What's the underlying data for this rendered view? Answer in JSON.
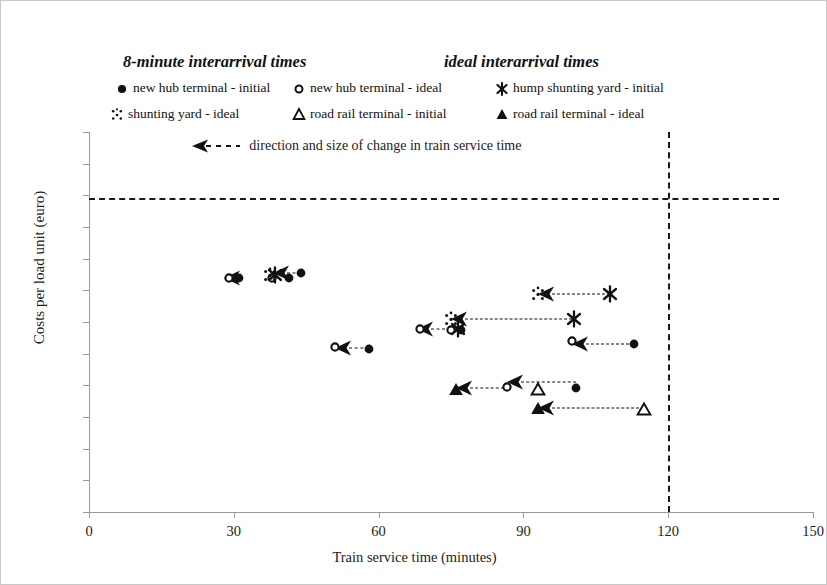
{
  "legend": {
    "group_titles": [
      {
        "text": "8-minute interarrival times"
      },
      {
        "text": "ideal interarrival times"
      }
    ],
    "entries": [
      {
        "label": "new hub terminal - initial",
        "marker": "filled-circle-icon"
      },
      {
        "label": "new hub terminal - ideal",
        "marker": "hollow-circle-icon"
      },
      {
        "label": "hump shunting yard - initial",
        "marker": "filled-star-icon"
      },
      {
        "label": "shunting yard - ideal",
        "marker": "dotted-star-icon"
      },
      {
        "label": "road rail terminal - initial",
        "marker": "hollow-triangle-icon"
      },
      {
        "label": "road rail terminal - ideal",
        "marker": "filled-triangle-icon"
      }
    ]
  },
  "annotation": {
    "text": "direction and size of change in train service time",
    "arrow": "left-dashed-arrow-icon"
  },
  "chart_data": {
    "type": "scatter",
    "title": "",
    "xlabel": "Train service time (minutes)",
    "ylabel": "Costs per load unit (euro)",
    "xlim": [
      0,
      150
    ],
    "ylim": [
      0,
      60
    ],
    "xticks": [
      0,
      30,
      60,
      90,
      120,
      150
    ],
    "yticks": [
      0,
      5,
      10,
      15,
      20,
      25,
      30,
      35,
      40,
      45,
      50,
      55,
      60
    ],
    "grid": false,
    "legend_position": "above-plot",
    "reference_lines": [
      {
        "name": "cost-threshold",
        "orient": "horizontal",
        "value": 49.6,
        "x_start": 0,
        "x_end": 143,
        "style": "dashed"
      },
      {
        "name": "time-threshold",
        "orient": "vertical",
        "value": 120,
        "y_start": 0,
        "y_end": 60,
        "style": "dashed"
      }
    ],
    "series": [
      {
        "name": "new hub terminal - initial",
        "marker": "filled-circle-icon",
        "points": [
          {
            "x": 31.0,
            "y": 37.0
          },
          {
            "x": 41.5,
            "y": 36.9
          },
          {
            "x": 44.0,
            "y": 37.7
          },
          {
            "x": 58.0,
            "y": 25.8
          },
          {
            "x": 77.0,
            "y": 28.8
          },
          {
            "x": 113.0,
            "y": 26.5
          },
          {
            "x": 101.0,
            "y": 19.6
          }
        ]
      },
      {
        "name": "new hub terminal - ideal",
        "marker": "hollow-circle-icon",
        "points": [
          {
            "x": 29.0,
            "y": 37.0
          },
          {
            "x": 38.0,
            "y": 37.0
          },
          {
            "x": 51.0,
            "y": 26.0
          },
          {
            "x": 68.5,
            "y": 28.9
          },
          {
            "x": 75.0,
            "y": 28.8
          },
          {
            "x": 100.0,
            "y": 27.0
          },
          {
            "x": 86.5,
            "y": 19.7
          }
        ]
      },
      {
        "name": "hump shunting yard - initial",
        "marker": "filled-star-icon",
        "points": [
          {
            "x": 38.5,
            "y": 37.4
          },
          {
            "x": 108.0,
            "y": 34.5
          },
          {
            "x": 100.5,
            "y": 30.5
          },
          {
            "x": 76.5,
            "y": 28.9
          }
        ]
      },
      {
        "name": "shunting yard - ideal",
        "marker": "dotted-star-icon",
        "points": [
          {
            "x": 37.5,
            "y": 37.5
          },
          {
            "x": 93.0,
            "y": 34.5
          },
          {
            "x": 75.0,
            "y": 30.5
          }
        ]
      },
      {
        "name": "road rail terminal - initial",
        "marker": "hollow-triangle-icon",
        "points": [
          {
            "x": 93.0,
            "y": 19.5
          },
          {
            "x": 115.0,
            "y": 16.3
          }
        ]
      },
      {
        "name": "road rail terminal - ideal",
        "marker": "filled-triangle-icon",
        "points": [
          {
            "x": 76.0,
            "y": 19.5
          },
          {
            "x": 93.0,
            "y": 16.5
          }
        ]
      }
    ],
    "change_arrows": [
      {
        "from_x": 31.0,
        "to_x": 29.5,
        "y": 37.0
      },
      {
        "from_x": 44.0,
        "to_x": 39.5,
        "y": 37.7
      },
      {
        "from_x": 58.0,
        "to_x": 52.5,
        "y": 25.9
      },
      {
        "from_x": 76.0,
        "to_x": 69.5,
        "y": 28.9
      },
      {
        "from_x": 108.0,
        "to_x": 94.5,
        "y": 34.5
      },
      {
        "from_x": 100.0,
        "to_x": 76.5,
        "y": 30.5
      },
      {
        "from_x": 113.0,
        "to_x": 101.5,
        "y": 26.6
      },
      {
        "from_x": 101.0,
        "to_x": 88.0,
        "y": 20.6
      },
      {
        "from_x": 86.0,
        "to_x": 77.5,
        "y": 19.6
      },
      {
        "from_x": 115.0,
        "to_x": 94.5,
        "y": 16.4
      }
    ]
  }
}
